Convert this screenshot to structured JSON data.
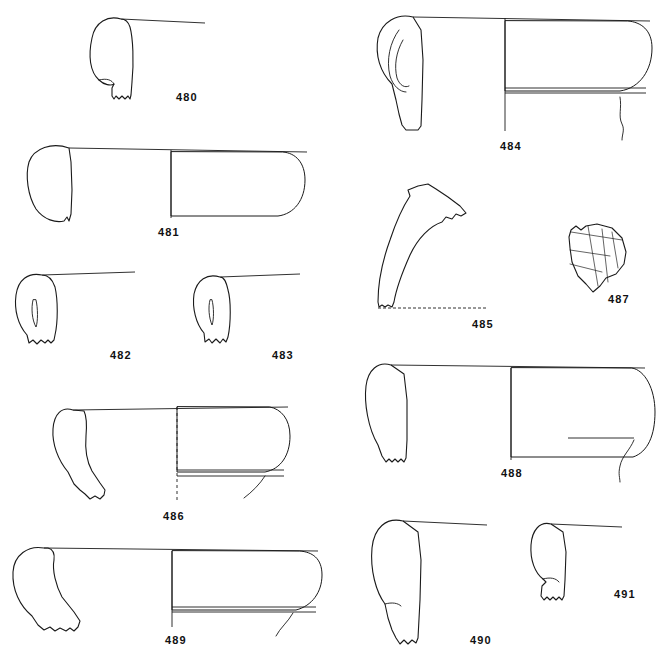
{
  "figure": {
    "type": "archaeological-pottery-profile-plate",
    "background_color": "#ffffff",
    "line_color": "#1a1a1a",
    "width": 661,
    "height": 657
  },
  "objects": [
    {
      "id": "480",
      "label": "480",
      "label_x": 176,
      "label_y": 91,
      "kind": "rim-profile",
      "section_side": "left",
      "has_rim_line": true,
      "rim_line": {
        "x1": 121,
        "y1": 19,
        "x2": 205,
        "y2": 23
      },
      "profile_path": "M121,19 C108,15 95,22 92,38 C88,56 90,72 99,80 C104,85 111,86 114,84 L114,84 L112,88 L112,96 L114,99 L116,96 L119,99 L122,96 L125,99 L128,96 L130,99 L131,95 L132,82 C134,62 133,38 130,27 C128,21 125,19 121,19 Z",
      "inner_path": "M99,80 C107,78 112,80 114,84"
    },
    {
      "id": "481",
      "label": "481",
      "label_x": 158,
      "label_y": 226,
      "kind": "rim-profile-with-section",
      "section_side": "left",
      "has_rim_line": true,
      "rim_line": {
        "x1": 69,
        "y1": 148,
        "x2": 307,
        "y2": 152
      },
      "profile_path": "M69,148 C52,142 34,148 29,162 C25,176 28,196 36,209 C44,220 56,223 64,221 L64,221 L67,217 L69,221 L71,214 L72,190 L71,162 Z",
      "section_outline": "M171,152 L171,216 L278,216 C294,214 305,200 305,180 C305,163 296,153 283,152 Z",
      "axis": {
        "x": 171,
        "y1": 150,
        "y2": 218
      }
    },
    {
      "id": "482",
      "label": "482",
      "label_x": 110,
      "label_y": 349,
      "kind": "handle-profile",
      "section_side": "left",
      "has_rim_line": true,
      "rim_line": {
        "x1": 42,
        "y1": 275,
        "x2": 135,
        "y2": 272
      },
      "profile_path": "M42,275 C28,272 18,280 16,295 C14,310 18,325 27,335 L29,343 L33,340 L37,344 L41,340 L45,343 L48,340 L51,343 L54,340 L55,335 C58,322 58,300 55,287 C52,278 48,275 42,275 Z",
      "inner_loop": "M33,300 C31,308 32,320 36,327 C38,322 38,308 36,300 Z"
    },
    {
      "id": "483",
      "label": "483",
      "label_x": 272,
      "label_y": 349,
      "kind": "handle-profile",
      "section_side": "left",
      "has_rim_line": true,
      "rim_line": {
        "x1": 220,
        "y1": 277,
        "x2": 300,
        "y2": 274
      },
      "profile_path": "M220,277 C207,273 197,280 194,294 C192,308 196,324 204,333 L205,342 L209,339 L212,343 L216,339 L220,343 L223,339 L226,342 L228,337 C231,323 231,300 228,290 C226,281 224,277 220,277 Z",
      "inner_loop": "M210,300 C208,307 209,318 212,325 C214,320 214,307 212,300 Z"
    },
    {
      "id": "484",
      "label": "484",
      "label_x": 500,
      "label_y": 140,
      "kind": "rim-profile-with-loop-handle",
      "section_side": "left",
      "has_rim_line": true,
      "rim_line": {
        "x1": 413,
        "y1": 17,
        "x2": 650,
        "y2": 21
      },
      "profile_path": "M413,17 C397,13 382,22 378,38 C375,55 380,72 392,84 L396,100 L399,114 L402,125 L406,130 L418,130 L421,126 L422,100 L423,60 L421,30 Z",
      "handle_loop_outer": "M399,30 C390,42 386,60 390,76 C393,86 400,92 406,92",
      "handle_loop_inner": "M403,40 C396,52 394,66 397,78 C400,86 405,88 409,86",
      "section_outline": "M505,21 L505,91 L620,91 C640,88 652,70 652,48 C652,30 641,22 628,21 Z",
      "section_bands": [
        {
          "y": 88
        },
        {
          "y": 93
        }
      ],
      "base_curve": "M620,97 C622,108 618,116 622,124 C625,130 622,134 622,140",
      "axis": {
        "x": 505,
        "y1": 18,
        "y2": 131
      }
    },
    {
      "id": "485",
      "label": "485",
      "label_x": 472,
      "label_y": 318,
      "kind": "handle-fragment",
      "section_side": "none",
      "has_rim_line": false,
      "profile_path": "M418,186 L428,184 L436,189 L448,197 L460,206 L466,213 L461,216 L456,214 L452,219 L446,217 L442,222 C430,226 418,238 410,255 C402,273 396,290 394,302 L392,307 L388,305 L385,307 L382,305 L379,307 L378,302 C378,286 382,262 390,240 C396,222 404,205 410,196 L408,190 Z",
      "baseline": {
        "x1": 378,
        "y1": 308,
        "x2": 487,
        "y2": 308,
        "dashed": true
      }
    },
    {
      "id": "486",
      "label": "486",
      "label_x": 163,
      "label_y": 510,
      "kind": "rim-profile-with-section",
      "section_side": "left",
      "has_rim_line": true,
      "rim_line": {
        "x1": 73,
        "y1": 410,
        "x2": 288,
        "y2": 407
      },
      "profile_path": "M73,410 C62,406 54,414 53,429 C52,444 58,460 68,472 L74,484 L80,490 L85,494 L90,499 L95,496 L100,499 L104,495 L105,490 L100,483 L92,471 C87,462 85,448 86,436 C87,424 86,415 84,411 Z",
      "section_outline": "M177,407 L177,472 L265,472 C281,469 290,455 290,436 C290,419 281,409 270,407 Z",
      "section_bands": [
        {
          "y": 470
        },
        {
          "y": 476
        }
      ],
      "base_curve": "M265,476 C260,484 252,492 244,498",
      "axis": {
        "x": 177,
        "y1": 407,
        "y2": 503,
        "dashed": true
      }
    },
    {
      "id": "487",
      "label": "487",
      "label_x": 608,
      "label_y": 293,
      "kind": "decorated-sherd",
      "section_side": "none",
      "has_rim_line": false,
      "profile_path": "M569,237 L571,230 L576,226 L581,230 L586,226 L597,224 L612,228 L622,238 L626,252 L624,264 L616,274 L606,278 L600,286 L593,292 L586,284 L578,276 L572,262 L570,248 Z",
      "decoration_lines": [
        "M571,232 L622,240",
        "M570,250 L610,256",
        "M570,264 L602,272",
        "M588,226 L598,286",
        "M602,229 L608,282",
        "M612,232 L618,268"
      ]
    },
    {
      "id": "488",
      "label": "488",
      "label_x": 501,
      "label_y": 467,
      "kind": "rim-profile-with-section",
      "section_side": "left",
      "has_rim_line": true,
      "rim_line": {
        "x1": 391,
        "y1": 365,
        "x2": 645,
        "y2": 368
      },
      "profile_path": "M391,365 C378,361 368,370 366,386 C364,403 368,428 378,445 L382,456 L386,462 L389,459 L392,462 L395,459 L398,462 L401,459 L404,462 L406,458 L407,440 L407,400 L404,374 Z",
      "section_outline": "M511,368 L511,457 L633,457 C648,452 655,435 655,412 C655,389 645,370 632,368 Z",
      "interior_line": {
        "x1": 568,
        "y1": 438,
        "x2": 634,
        "y2": 438
      },
      "base_curve": "M634,440 C630,450 622,456 620,466 C618,474 620,478 620,482",
      "axis": {
        "x": 511,
        "y1": 368,
        "y2": 460
      }
    },
    {
      "id": "489",
      "label": "489",
      "label_x": 165,
      "label_y": 634,
      "kind": "rim-profile-with-section",
      "section_side": "left",
      "has_rim_line": true,
      "rim_line": {
        "x1": 44,
        "y1": 548,
        "x2": 318,
        "y2": 551
      },
      "profile_path": "M44,548 C28,545 14,555 13,572 C12,590 20,606 32,616 L38,625 L44,630 L50,627 L55,631 L60,628 L66,631 L70,628 L74,631 L78,627 L80,621 L74,612 L62,597 C56,586 52,570 54,560 C55,552 52,549 48,548 Z",
      "section_outline": "M172,551 L172,610 L296,610 C312,606 322,592 322,575 C322,558 312,552 300,551 Z",
      "section_bands": [
        {
          "y": 607
        },
        {
          "y": 612
        }
      ],
      "base_curve": "M293,613 C288,622 280,628 276,636",
      "axis": {
        "x": 172,
        "y1": 551,
        "y2": 627
      }
    },
    {
      "id": "490",
      "label": "490",
      "label_x": 470,
      "label_y": 634,
      "kind": "rim-profile",
      "section_side": "left",
      "has_rim_line": true,
      "rim_line": {
        "x1": 403,
        "y1": 521,
        "x2": 487,
        "y2": 525
      },
      "profile_path": "M403,521 C386,517 374,528 372,548 C370,570 376,592 385,604 L388,618 L392,630 L396,638 L400,644 L404,640 L408,644 L412,640 L416,643 L418,638 L420,600 L421,560 L418,532 Z",
      "waist": "M385,604 C392,602 398,603 401,606"
    },
    {
      "id": "491",
      "label": "491",
      "label_x": 614,
      "label_y": 588,
      "kind": "rim-profile",
      "section_side": "left",
      "has_rim_line": true,
      "rim_line": {
        "x1": 551,
        "y1": 524,
        "x2": 622,
        "y2": 527
      },
      "profile_path": "M551,524 C540,521 532,530 531,545 C530,560 535,573 543,579 L546,582 L542,586 L541,596 L544,600 L547,597 L550,600 L553,597 L556,600 L559,597 L562,600 L564,596 L565,580 L566,552 L563,532 Z",
      "inner_notch": "M543,579 C550,577 556,578 559,582"
    }
  ]
}
